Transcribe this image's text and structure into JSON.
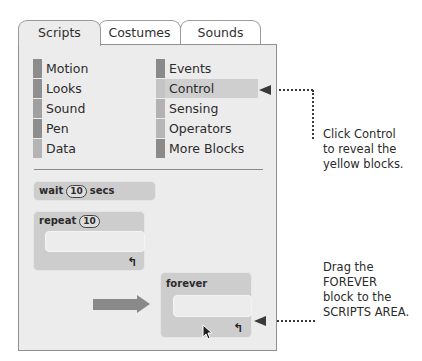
{
  "tabs": [
    {
      "label": "Scripts",
      "active": true
    },
    {
      "label": "Costumes",
      "active": false
    },
    {
      "label": "Sounds",
      "active": false
    }
  ],
  "categories": {
    "left": [
      {
        "label": "Motion",
        "color": "#8c8c8c"
      },
      {
        "label": "Looks",
        "color": "#8f8f8f"
      },
      {
        "label": "Sound",
        "color": "#a0a0a0"
      },
      {
        "label": "Pen",
        "color": "#8e8e8e"
      },
      {
        "label": "Data",
        "color": "#b4b4b4"
      }
    ],
    "right": [
      {
        "label": "Events",
        "color": "#8a8a8a"
      },
      {
        "label": "Control",
        "color": "#c4c4c4",
        "selected": true
      },
      {
        "label": "Sensing",
        "color": "#b2b2b2"
      },
      {
        "label": "Operators",
        "color": "#b6b6b6"
      },
      {
        "label": "More Blocks",
        "color": "#8b8b8b"
      }
    ]
  },
  "blocks": {
    "wait": {
      "prefix": "wait",
      "value": "10",
      "suffix": "secs"
    },
    "repeat": {
      "prefix": "repeat",
      "value": "10",
      "loop_icon": "↰"
    },
    "forever": {
      "label": "forever",
      "loop_icon": "↰"
    }
  },
  "annotations": {
    "control_note": "Click Control\nto reveal the\nyellow blocks.",
    "drag_note": "Drag the\nFOREVER\nblock to the\nSCRIPTS AREA."
  }
}
